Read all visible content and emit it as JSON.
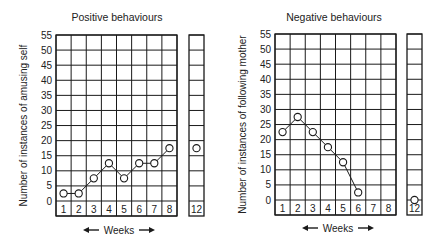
{
  "chart_data": [
    {
      "type": "line",
      "title": "Positive behaviours",
      "xlabel": "Weeks",
      "ylabel": "Number of instances of amusing self",
      "ylim": [
        0,
        55
      ],
      "yticks": [
        0,
        5,
        10,
        15,
        20,
        25,
        30,
        35,
        40,
        45,
        50,
        55
      ],
      "categories": [
        "1",
        "2",
        "3",
        "4",
        "5",
        "6",
        "7",
        "8",
        "12"
      ],
      "x": [
        1,
        2,
        3,
        4,
        5,
        6,
        7,
        8,
        12
      ],
      "values": [
        2.5,
        2.5,
        7.5,
        12.5,
        7.5,
        12.5,
        12.5,
        17.5,
        17.5
      ],
      "connected_through": 8,
      "grid": true,
      "legend": null
    },
    {
      "type": "line",
      "title": "Negative behaviours",
      "xlabel": "Weeks",
      "ylabel": "Number of instances of following mother",
      "ylim": [
        0,
        55
      ],
      "yticks": [
        0,
        5,
        10,
        15,
        20,
        25,
        30,
        35,
        40,
        45,
        50,
        55
      ],
      "categories": [
        "1",
        "2",
        "3",
        "4",
        "5",
        "6",
        "7",
        "8",
        "12"
      ],
      "x": [
        1,
        2,
        3,
        4,
        5,
        6,
        12
      ],
      "values": [
        22.5,
        27.5,
        22.5,
        17.5,
        12.5,
        2.5,
        0
      ],
      "connected_through": 6,
      "grid": true,
      "legend": null
    }
  ],
  "charts": {
    "left": {
      "title": "Positive behaviours",
      "ylabel": "Number of instances of amusing self",
      "xlabel": "Weeks",
      "arrow_left": "←",
      "arrow_right": "→"
    },
    "right": {
      "title": "Negative behaviours",
      "ylabel": "Number of instances of following mother",
      "xlabel": "Weeks",
      "arrow_left": "←",
      "arrow_right": "→"
    }
  }
}
